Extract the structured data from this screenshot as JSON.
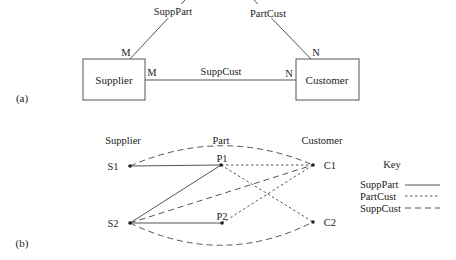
{
  "part_a": {
    "label": "(a)",
    "entities": {
      "supplier": "Supplier",
      "customer": "Customer"
    },
    "relationships": {
      "supp_part": {
        "label": "SuppPart",
        "card_supplier": "M"
      },
      "part_cust": {
        "label": "PartCust",
        "card_customer": "N"
      },
      "supp_cust": {
        "label": "SuppCust",
        "card_supplier": "M",
        "card_customer": "N"
      }
    }
  },
  "part_b": {
    "label": "(b)",
    "columns": {
      "supplier": "Supplier",
      "part": "Part",
      "customer": "Customer"
    },
    "nodes": {
      "s1": "S1",
      "s2": "S2",
      "p1": "P1",
      "p2": "P2",
      "c1": "C1",
      "c2": "C2"
    },
    "edges": {
      "SuppPart": [
        [
          "S1",
          "P1"
        ],
        [
          "S2",
          "P1"
        ],
        [
          "S2",
          "P2"
        ]
      ],
      "PartCust": [
        [
          "P1",
          "C1"
        ],
        [
          "P1",
          "C2"
        ],
        [
          "P2",
          "C1"
        ]
      ],
      "SuppCust": [
        [
          "S1",
          "C1"
        ],
        [
          "S2",
          "C1"
        ],
        [
          "S2",
          "C2"
        ]
      ]
    },
    "key": {
      "title": "Key",
      "items": [
        {
          "label": "SuppPart",
          "style": "solid"
        },
        {
          "label": "PartCust",
          "style": "dotted"
        },
        {
          "label": "SuppCust",
          "style": "dashed"
        }
      ]
    }
  },
  "colors": {
    "line": "#444444",
    "text": "#222222"
  }
}
